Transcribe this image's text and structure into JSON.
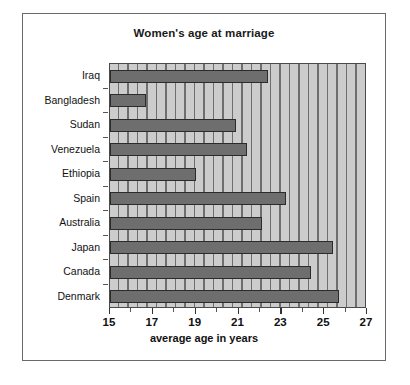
{
  "chart_data": {
    "type": "bar",
    "orientation": "horizontal",
    "title": "Women's age at marriage",
    "xlabel": "average age in years",
    "ylabel": "",
    "xlim": [
      15,
      27
    ],
    "xticks": [
      15,
      17,
      19,
      21,
      23,
      25,
      27
    ],
    "xtick_labels": [
      "15",
      "17",
      "19",
      "21",
      "23",
      "25",
      "27"
    ],
    "minor_tick_step": 1,
    "grid": false,
    "legend": null,
    "categories": [
      "Iraq",
      "Bangladesh",
      "Sudan",
      "Venezuela",
      "Ethiopia",
      "Spain",
      "Australia",
      "Japan",
      "Canada",
      "Denmark"
    ],
    "values": [
      22.4,
      16.7,
      20.9,
      21.4,
      19.0,
      23.2,
      22.1,
      25.4,
      24.4,
      25.7
    ],
    "bar_color": "#6e6e6e",
    "bar_edge_color": "#2b2b2b",
    "plot_background": "#c9c9c9",
    "figure_background": "#ffffff",
    "border_color": "#6a6a6a"
  }
}
